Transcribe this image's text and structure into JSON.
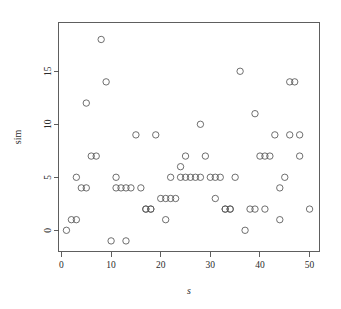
{
  "chart_data": {
    "type": "scatter",
    "title": "",
    "subtitle": "",
    "xlabel": "s",
    "ylabel": "sim",
    "xlim": [
      -0.6,
      52.0
    ],
    "ylim": [
      -2.0,
      19.6
    ],
    "grid": false,
    "legend": null,
    "legend_position": "none",
    "x_ticks": [
      0,
      10,
      20,
      30,
      40,
      50
    ],
    "x_tick_labels": [
      "0",
      "10",
      "20",
      "30",
      "40",
      "50"
    ],
    "y_ticks": [
      0,
      5,
      10,
      15
    ],
    "y_tick_labels": [
      "0",
      "5",
      "10",
      "15"
    ],
    "marker": "open-circle",
    "marker_color": "#555555",
    "marker_size": 3.2,
    "point_count": 63,
    "series": [
      {
        "name": "sim",
        "x": [
          1,
          2,
          3,
          3,
          4,
          5,
          5,
          6,
          7,
          8,
          9,
          10,
          11,
          11,
          12,
          13,
          13,
          14,
          15,
          16,
          17,
          17,
          18,
          18,
          19,
          20,
          21,
          21,
          22,
          22,
          23,
          24,
          24,
          25,
          25,
          26,
          27,
          28,
          28,
          29,
          30,
          31,
          31,
          32,
          33,
          33,
          34,
          34,
          35,
          36,
          37,
          38,
          39,
          39,
          40,
          41,
          41,
          42,
          43,
          44,
          44,
          45,
          46,
          46,
          47,
          48,
          48,
          50
        ],
        "y": [
          0,
          1,
          1,
          5,
          4,
          4,
          12,
          7,
          7,
          18,
          14,
          -1,
          4,
          5,
          4,
          -1,
          4,
          4,
          9,
          4,
          2,
          2,
          2,
          2,
          9,
          3,
          1,
          3,
          3,
          5,
          3,
          5,
          6,
          5,
          7,
          5,
          5,
          10,
          5,
          7,
          5,
          3,
          5,
          5,
          2,
          2,
          2,
          2,
          5,
          15,
          0,
          2,
          2,
          11,
          7,
          2,
          7,
          7,
          9,
          1,
          4,
          5,
          14,
          9,
          14,
          7,
          9,
          2
        ]
      }
    ]
  },
  "figure": {
    "background_color": "#ffffff",
    "axis_color": "#4d4d4d",
    "text_color": "#2b2b2b"
  }
}
